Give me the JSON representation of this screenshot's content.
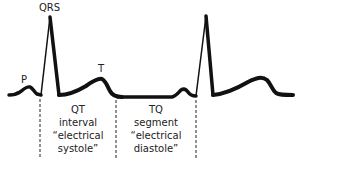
{
  "diagram": {
    "type": "ECG waveform",
    "wave_labels": {
      "p": "P",
      "qrs": "QRS",
      "t": "T"
    },
    "segments": [
      {
        "id": "qt",
        "lines": [
          "QT",
          "interval",
          "“electrical",
          "systole”"
        ]
      },
      {
        "id": "tq",
        "lines": [
          "TQ",
          "segment",
          "“electrical",
          "diastole”"
        ]
      }
    ],
    "colors": {
      "trace": "#111111",
      "text": "#222222",
      "background": "#ffffff"
    }
  }
}
